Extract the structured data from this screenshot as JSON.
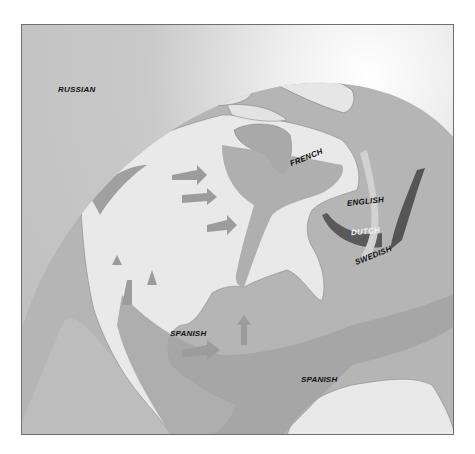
{
  "map": {
    "title": "",
    "style": "grayscale orthographic globe of North America with colonial claim zones",
    "colors": {
      "ocean": "#b4b4b4",
      "land": "#e9e9e9",
      "claim_zone": "#a6a6a6",
      "claim_zone_dark": "#9a9a9a",
      "dutch_band": "#5a5a5a",
      "english_band": "#555555",
      "swedish_band": "#cfcfcf",
      "arrow": "#999999",
      "frame_border": "#6f6f6f"
    },
    "labels": {
      "russian": "RUSSIAN",
      "french": "FRENCH",
      "english": "ENGLISH",
      "dutch": "DUTCH",
      "swedish": "SWEDISH",
      "spanish_north_america": "SPANISH",
      "spanish_caribbean": "SPANISH"
    }
  }
}
